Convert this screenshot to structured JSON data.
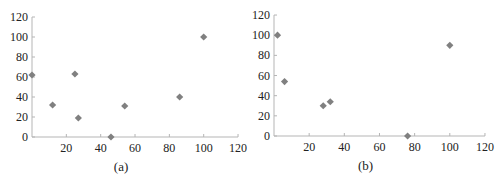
{
  "chart_data": [
    {
      "type": "scatter",
      "title": "",
      "caption": "(a)",
      "xlabel": "",
      "ylabel": "",
      "xlim": [
        0,
        120
      ],
      "ylim": [
        0,
        120
      ],
      "xticks": [
        20,
        40,
        60,
        80,
        100,
        120
      ],
      "yticks": [
        0,
        20,
        40,
        60,
        80,
        100,
        120
      ],
      "grid": false,
      "legend": null,
      "marker": "diamond",
      "marker_color": "#808080",
      "points": [
        {
          "x": 0,
          "y": 62
        },
        {
          "x": 12,
          "y": 32
        },
        {
          "x": 25,
          "y": 63
        },
        {
          "x": 27,
          "y": 19
        },
        {
          "x": 46,
          "y": 0
        },
        {
          "x": 54,
          "y": 31
        },
        {
          "x": 86,
          "y": 40
        },
        {
          "x": 100,
          "y": 100
        }
      ]
    },
    {
      "type": "scatter",
      "title": "",
      "caption": "(b)",
      "xlabel": "",
      "ylabel": "",
      "xlim": [
        0,
        120
      ],
      "ylim": [
        0,
        120
      ],
      "xticks": [
        20,
        40,
        60,
        80,
        100,
        120
      ],
      "yticks": [
        0,
        20,
        40,
        60,
        80,
        100,
        120
      ],
      "grid": false,
      "legend": null,
      "marker": "diamond",
      "marker_color": "#808080",
      "points": [
        {
          "x": 2,
          "y": 100
        },
        {
          "x": 6,
          "y": 54
        },
        {
          "x": 28,
          "y": 30
        },
        {
          "x": 32,
          "y": 34
        },
        {
          "x": 76,
          "y": 0
        },
        {
          "x": 100,
          "y": 90
        }
      ]
    }
  ]
}
